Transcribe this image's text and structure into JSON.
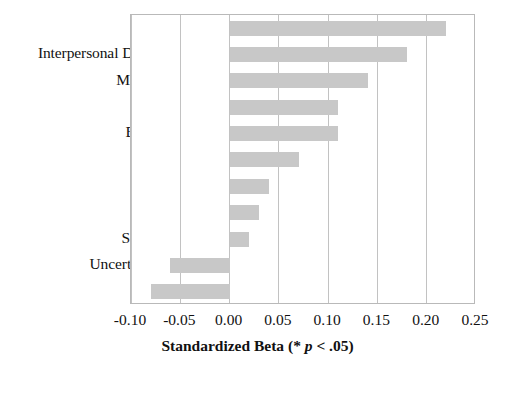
{
  "chart_data": {
    "type": "bar",
    "orientation": "horizontal",
    "title": "",
    "xlabel": "Standardized Beta (* p < .05)",
    "ylabel": "",
    "xlim": [
      -0.1,
      0.25
    ],
    "xticks": [
      -0.1,
      -0.05,
      0.0,
      0.05,
      0.1,
      0.15,
      0.2,
      0.25
    ],
    "xtick_labels": [
      "-0.10",
      "-0.05",
      "0.00",
      "0.05",
      "0.10",
      "0.15",
      "0.20",
      "0.25"
    ],
    "grid": true,
    "grid_axis": "x",
    "legend": false,
    "bar_color": "#c8c8c8",
    "categories": [
      "Self-Esteem*",
      "Interpersonal Distinctiveness*",
      "Meaning in Life*",
      "Friendships*",
      "Belongingness*",
      "Social support",
      "Continuity",
      "World-View",
      "Self-Verification",
      "Uncertainty reduction",
      "Efficacy"
    ],
    "values": [
      0.22,
      0.18,
      0.14,
      0.11,
      0.11,
      0.07,
      0.04,
      0.03,
      0.02,
      -0.06,
      -0.08
    ]
  },
  "axis_title": {
    "prefix": "Standardized Beta (* ",
    "italic": "p",
    "suffix": " < .05)"
  }
}
